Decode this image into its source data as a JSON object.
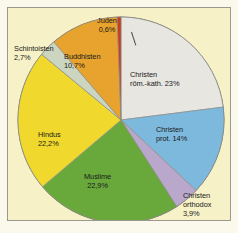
{
  "figure": {
    "background_color": "#fbf8ec",
    "plot_background_color": "#f6f1c6",
    "border_color": "#9a9890"
  },
  "chart_data": {
    "type": "pie",
    "title": "",
    "subtitle": "",
    "xlabel": "",
    "ylabel": "",
    "legend_position": "none",
    "grid": false,
    "units": "percent",
    "start_angle_deg": 0,
    "direction": "clockwise",
    "categories": [
      "Christen röm.-kath.",
      "Christen prot.",
      "Christen orthodox",
      "Muslime",
      "Hindus",
      "Schintoisten",
      "Buddhisten",
      "Juden"
    ],
    "values": [
      23,
      14,
      3.9,
      22.9,
      22.2,
      2.7,
      10.7,
      0.6
    ],
    "value_labels": [
      "23%",
      "14%",
      "3,9%",
      "22,9%",
      "22,2%",
      "2,7%",
      "10,7%",
      "0,6%"
    ],
    "colors": [
      "#e7e6e0",
      "#7db9dd",
      "#b9a8cc",
      "#69a83b",
      "#f0d92c",
      "#ccd5bf",
      "#e8a22e",
      "#cf3a19"
    ],
    "slices": [
      {
        "name": "christen-roem-kath",
        "label_line1": "Christen",
        "label_line2": "röm.-kath. 23%",
        "value": 23,
        "value_label": "23%",
        "color": "#e7e6e0"
      },
      {
        "name": "christen-prot",
        "label_line1": "Christen",
        "label_line2": "prot. 14%",
        "value": 14,
        "value_label": "14%",
        "color": "#7db9dd"
      },
      {
        "name": "christen-orthodox",
        "label_line1": "Christen",
        "label_line2": "orthodox",
        "label_line3": "3,9%",
        "value": 3.9,
        "value_label": "3,9%",
        "color": "#b9a8cc"
      },
      {
        "name": "muslime",
        "label_line1": "Muslime",
        "label_line2": "22,9%",
        "value": 22.9,
        "value_label": "22,9%",
        "color": "#69a83b"
      },
      {
        "name": "hindus",
        "label_line1": "Hindus",
        "label_line2": "22,2%",
        "value": 22.2,
        "value_label": "22,2%",
        "color": "#f0d92c"
      },
      {
        "name": "schintoisten",
        "label_line1": "Schintoisten",
        "label_line2": "2,7%",
        "value": 2.7,
        "value_label": "2,7%",
        "color": "#ccd5bf"
      },
      {
        "name": "buddhisten",
        "label_line1": "Buddhisten",
        "label_line2": "10,7%",
        "value": 10.7,
        "value_label": "10,7%",
        "color": "#e8a22e"
      },
      {
        "name": "juden",
        "label_line1": "Juden",
        "label_line2": "0,6%",
        "value": 0.6,
        "value_label": "0,6%",
        "color": "#cf3a19"
      }
    ]
  }
}
